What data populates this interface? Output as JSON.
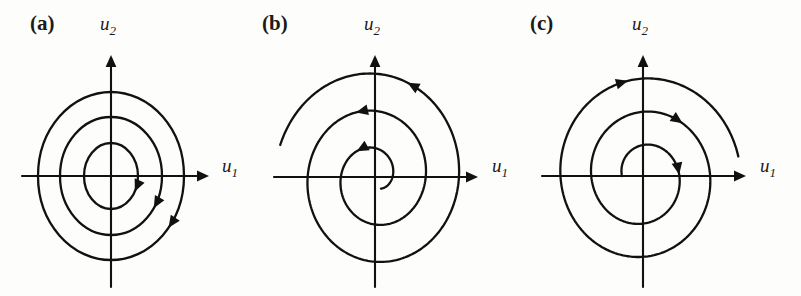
{
  "figure": {
    "background_color": "#fdfdfb",
    "line_color": "#111111",
    "width": 801,
    "height": 296
  },
  "panels": [
    {
      "label": "(a)",
      "label_x": 30,
      "label_y": 30,
      "kind": "center",
      "description": "Center: three concentric closed elliptical orbits traversed clockwise",
      "origin": {
        "x": 111,
        "y": 176
      },
      "axis": {
        "x_label": "u",
        "x_sub": "1",
        "y_label": "u",
        "y_sub": "2",
        "x_label_x": 222,
        "x_label_y": 172,
        "y_label_x": 100,
        "y_label_y": 30,
        "x_start": 22,
        "x_end": 209,
        "y_start": 287,
        "y_end": 55
      },
      "rotation": "clockwise",
      "orbits": [
        {
          "rx": 27,
          "ry": 33
        },
        {
          "rx": 51,
          "ry": 59
        },
        {
          "rx": 73,
          "ry": 84
        }
      ],
      "arrows": [
        {
          "angle": -28,
          "ring": 0
        },
        {
          "angle": -33,
          "ring": 1
        },
        {
          "angle": -38,
          "ring": 2
        }
      ]
    },
    {
      "label": "(b)",
      "label_x": 262,
      "label_y": 30,
      "kind": "spiral",
      "description": "Unstable spiral: single trajectory winding outward clockwise from near the origin",
      "origin": {
        "x": 375,
        "y": 177
      },
      "axis": {
        "x_label": "u",
        "x_sub": "1",
        "y_label": "u",
        "y_sub": "2",
        "x_label_x": 492,
        "x_label_y": 172,
        "y_label_x": 364,
        "y_label_y": 30,
        "x_start": 274,
        "x_end": 478,
        "y_start": 287,
        "y_end": 55
      },
      "rotation": "clockwise",
      "spiral": {
        "start_angle_deg": -60,
        "turns": 2.62,
        "r_start": 12,
        "r_end": 99,
        "squish_y": 1.12
      },
      "arrows": [
        {
          "t": 0.2
        },
        {
          "t": 0.56
        },
        {
          "t": 0.9
        }
      ]
    },
    {
      "label": "(c)",
      "label_x": 530,
      "label_y": 30,
      "kind": "spiral",
      "description": "Unstable spiral: single trajectory winding outward counter-clockwise from near the origin",
      "origin": {
        "x": 643,
        "y": 176
      },
      "axis": {
        "x_label": "u",
        "x_sub": "1",
        "y_label": "u",
        "y_sub": "2",
        "x_label_x": 760,
        "x_label_y": 172,
        "y_label_x": 632,
        "y_label_y": 30,
        "x_start": 542,
        "x_end": 746,
        "y_start": 287,
        "y_end": 55
      },
      "rotation": "counter-clockwise",
      "spiral": {
        "start_angle_deg": 180,
        "turns": 2.47,
        "r_start": 21,
        "r_end": 97,
        "squish_y": 1.08
      },
      "arrows": [
        {
          "t": 0.2
        },
        {
          "t": 0.55
        },
        {
          "t": 0.9
        }
      ]
    }
  ],
  "chart_data": {
    "type": "line",
    "title": "",
    "xlabel": "u_1",
    "ylabel": "u_2",
    "grid": false,
    "legend": "none",
    "subplots": [
      {
        "name": "(a)",
        "phase_portrait": "center",
        "direction": "clockwise",
        "closed_orbits": 3,
        "orbit_semi_axes": [
          [
            27,
            33
          ],
          [
            51,
            59
          ],
          [
            73,
            84
          ]
        ]
      },
      {
        "name": "(b)",
        "phase_portrait": "unstable spiral",
        "direction": "clockwise",
        "turns": 2.62,
        "radius_range": [
          12,
          99
        ]
      },
      {
        "name": "(c)",
        "phase_portrait": "unstable spiral",
        "direction": "counter-clockwise",
        "turns": 2.47,
        "radius_range": [
          21,
          97
        ]
      }
    ]
  }
}
